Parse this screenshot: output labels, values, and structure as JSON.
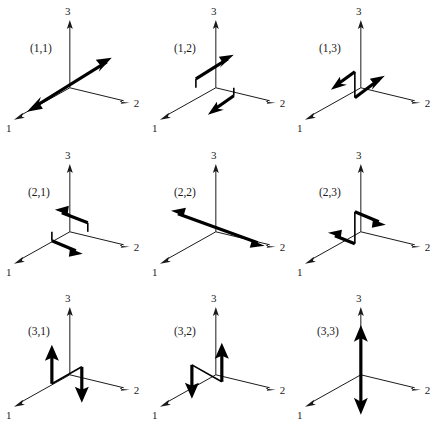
{
  "figure": {
    "type": "vector-diagram-grid",
    "rows": 3,
    "columns": 3,
    "background_color": "#ffffff",
    "axis_color": "#1a1a1a",
    "vector_color": "#000000"
  },
  "axes": {
    "labels": {
      "axis1": "1",
      "axis2": "2",
      "axis3": "3"
    },
    "geometry": {
      "origin": [
        70,
        88
      ],
      "axis1_tip": [
        14,
        120
      ],
      "axis2_tip": [
        128,
        103
      ],
      "axis3_tip": [
        70,
        22
      ]
    }
  },
  "panels": [
    {
      "label": "(1,1)",
      "row": 1,
      "column": 1,
      "style": "double-headed",
      "arrows": [
        {
          "direction": "upper-right",
          "head": true
        },
        {
          "direction": "lower-left",
          "head": true
        }
      ]
    },
    {
      "label": "(1,2)",
      "row": 1,
      "column": 2,
      "style": "stepped-pair",
      "arrows": [
        {
          "direction": "upper-right",
          "head": true
        },
        {
          "direction": "lower-left",
          "head": true
        }
      ]
    },
    {
      "label": "(1,3)",
      "row": 1,
      "column": 3,
      "style": "stepped-pair",
      "arrows": [
        {
          "direction": "upper-left",
          "head": true
        },
        {
          "direction": "upper-right",
          "head": true
        }
      ]
    },
    {
      "label": "(2,1)",
      "row": 2,
      "column": 1,
      "style": "stepped-pair",
      "arrows": [
        {
          "direction": "upper-left",
          "head": true
        },
        {
          "direction": "lower-right",
          "head": true
        }
      ]
    },
    {
      "label": "(2,2)",
      "row": 2,
      "column": 2,
      "style": "double-headed",
      "arrows": [
        {
          "direction": "upper-left",
          "head": true
        },
        {
          "direction": "lower-right",
          "head": true
        }
      ]
    },
    {
      "label": "(2,3)",
      "row": 2,
      "column": 3,
      "style": "stepped-pair",
      "arrows": [
        {
          "direction": "lower-right",
          "head": true
        },
        {
          "direction": "upper-left",
          "head": true
        }
      ]
    },
    {
      "label": "(3,1)",
      "row": 3,
      "column": 1,
      "style": "stepped-pair",
      "arrows": [
        {
          "direction": "up",
          "head": true
        },
        {
          "direction": "down",
          "head": true
        }
      ]
    },
    {
      "label": "(3,2)",
      "row": 3,
      "column": 2,
      "style": "stepped-pair",
      "arrows": [
        {
          "direction": "down",
          "head": true
        },
        {
          "direction": "up",
          "head": true
        }
      ]
    },
    {
      "label": "(3,3)",
      "row": 3,
      "column": 3,
      "style": "double-headed",
      "arrows": [
        {
          "direction": "up",
          "head": true
        },
        {
          "direction": "down",
          "head": true
        }
      ]
    }
  ]
}
